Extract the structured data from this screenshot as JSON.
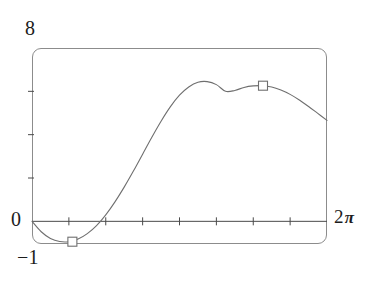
{
  "figure": {
    "name": "function-plot",
    "background_color": "#ffffff",
    "frame_color": "#8c8c8c",
    "curve_color": "#6f6f6f",
    "axis_color": "#4a4a4a",
    "text_color": "#1c1c1c"
  },
  "labels": {
    "y_max": "8",
    "y_zero": "0",
    "y_min": "−1",
    "x_max_number": "2",
    "x_max_symbol": "π"
  },
  "chart_data": {
    "type": "line",
    "title": "",
    "xlabel": "",
    "ylabel": "",
    "xlim": [
      0,
      6.283185307179586
    ],
    "ylim": [
      -1,
      8
    ],
    "grid": false,
    "legend": null,
    "x_tick_count": 7,
    "x_tick_values": [
      0.7853981634,
      1.5707963268,
      2.3561944902,
      3.1415926536,
      3.926990817,
      4.7123889804,
      5.4977871438
    ],
    "x_tick_labels": [
      "",
      "",
      "",
      "",
      "",
      "",
      ""
    ],
    "y_tick_values": [
      2,
      4,
      6
    ],
    "y_tick_labels": [
      "",
      "",
      ""
    ],
    "y_axis_labeled": [
      "0",
      "8",
      "−1"
    ],
    "x_axis_labeled": [
      "2π"
    ],
    "series": [
      {
        "name": "curve",
        "marker": "square",
        "marker_points": [
          {
            "x": 0.86,
            "y": -0.94
          },
          {
            "x": 4.92,
            "y": 6.26
          }
        ],
        "x": [
          0.0,
          0.1963,
          0.3927,
          0.589,
          0.7854,
          0.9817,
          1.1781,
          1.3744,
          1.5708,
          1.7671,
          1.9635,
          2.1598,
          2.3562,
          2.5525,
          2.7489,
          2.9452,
          3.1416,
          3.3379,
          3.5343,
          3.7306,
          3.927,
          4.1233,
          4.3197,
          4.516,
          4.7124,
          4.9087,
          5.1051,
          5.3014,
          5.4978,
          5.6941,
          5.8905,
          6.0868,
          6.2832
        ],
        "y": [
          0.0,
          -0.48,
          -0.79,
          -0.93,
          -0.94,
          -0.82,
          -0.57,
          -0.2,
          0.3,
          0.9,
          1.58,
          2.32,
          3.1,
          3.88,
          4.62,
          5.28,
          5.82,
          6.2,
          6.42,
          6.45,
          6.31,
          6.0,
          6.04,
          6.18,
          6.25,
          6.26,
          6.2,
          6.06,
          5.86,
          5.6,
          5.3,
          4.98,
          4.66
        ]
      }
    ]
  }
}
